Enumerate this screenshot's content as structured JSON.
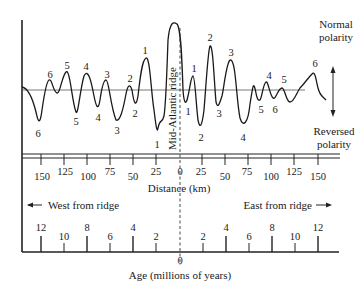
{
  "diagram": {
    "type": "magnetic-anomaly-profile",
    "ridge_label": "Mid-Atlantic ridge",
    "polarity": {
      "normal_label": [
        "Normal",
        "polarity"
      ],
      "reversed_label": [
        "Reversed",
        "polarity"
      ]
    },
    "anomaly_labels_west_peaks": [
      "6",
      "5",
      "4",
      "3",
      "2",
      "1"
    ],
    "anomaly_labels_west_troughs": [
      "6",
      "5",
      "4",
      "3",
      "2",
      "1"
    ],
    "anomaly_labels_east_peaks": [
      "1",
      "2",
      "3",
      "4",
      "5",
      "6"
    ],
    "anomaly_labels_east_troughs": [
      "1",
      "2",
      "3",
      "4",
      "5",
      "6"
    ],
    "distance_axis": {
      "title": "Distance (km)",
      "ticks": [
        "150",
        "125",
        "100",
        "75",
        "50",
        "25",
        "0",
        "25",
        "50",
        "75",
        "100",
        "125",
        "150"
      ]
    },
    "direction": {
      "west": "West from ridge",
      "east": "East from ridge"
    },
    "age_axis": {
      "title": "Age (millions of years)",
      "zero": "0",
      "west_ticks": [
        "12",
        "10",
        "8",
        "6",
        "4",
        "2"
      ],
      "east_ticks": [
        "2",
        "4",
        "6",
        "8",
        "10",
        "12"
      ]
    }
  }
}
